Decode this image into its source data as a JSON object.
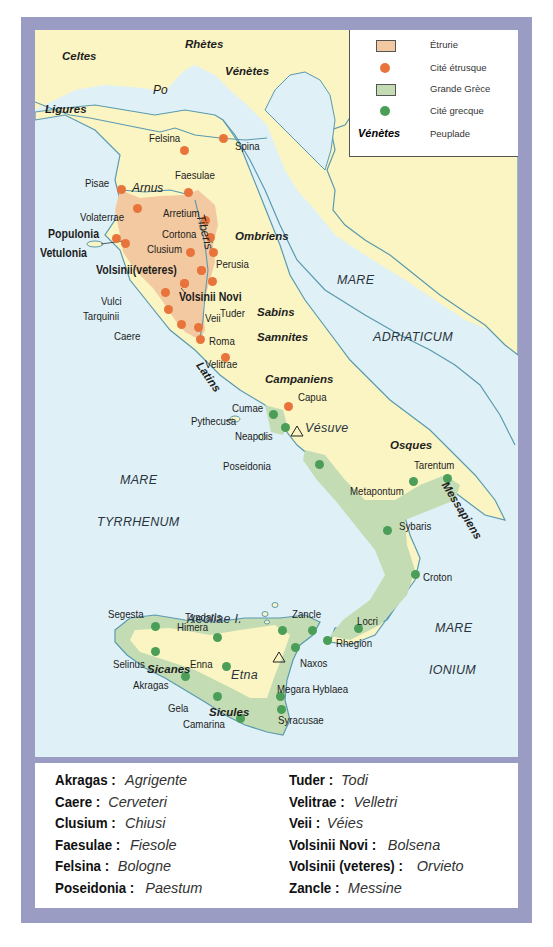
{
  "colors": {
    "frame": "#9a9cc4",
    "sea": "#dff0f6",
    "land": "#fbf5c3",
    "etruria": "#f2c9a0",
    "magna_graecia": "#c4dcb4",
    "coast": "#5a9ab0",
    "etruscan_city": "#e8743c",
    "greek_city": "#4a9e58"
  },
  "legend": {
    "items": [
      {
        "symbol": "etruria-swatch",
        "label": "Étrurie"
      },
      {
        "symbol": "etruscan-city-dot",
        "label": "Cité étrusque"
      },
      {
        "symbol": "magna-graecia-swatch",
        "label": "Grande Grèce"
      },
      {
        "symbol": "greek-city-dot",
        "label": "Cité grecque"
      },
      {
        "symbol": "Vénètes",
        "label": "Peuplade"
      }
    ]
  },
  "map": {
    "peoples": [
      {
        "name": "Celtes",
        "x": 27,
        "y": 21
      },
      {
        "name": "Rhètes",
        "x": 150,
        "y": 9
      },
      {
        "name": "Vénètes",
        "x": 190,
        "y": 36
      },
      {
        "name": "Ligures",
        "x": 10,
        "y": 74
      },
      {
        "name": "Ombriens",
        "x": 200,
        "y": 201
      },
      {
        "name": "Sabins",
        "x": 222,
        "y": 277
      },
      {
        "name": "Samnites",
        "x": 222,
        "y": 302
      },
      {
        "name": "Campaniens",
        "x": 230,
        "y": 344
      },
      {
        "name": "Osques",
        "x": 355,
        "y": 410
      },
      {
        "name": "Sicanes",
        "x": 112,
        "y": 634
      },
      {
        "name": "Sicules",
        "x": 174,
        "y": 677
      }
    ],
    "rotated_peoples": [
      {
        "name": "Latins",
        "x": 168,
        "y": 330,
        "rotate": 55
      },
      {
        "name": "Messapiens",
        "x": 414,
        "y": 450,
        "rotate": 58
      }
    ],
    "rivers": [
      {
        "name": "Po",
        "x": 118,
        "y": 54
      },
      {
        "name": "Arnus",
        "x": 97,
        "y": 152
      }
    ],
    "rotated_rivers": [
      {
        "name": "Tiberis",
        "x": 171,
        "y": 183,
        "rotate": 75
      }
    ],
    "seas": [
      {
        "name": "MARE",
        "x": 302,
        "y": 244
      },
      {
        "name": "ADRIATICUM",
        "x": 338,
        "y": 301
      },
      {
        "name": "MARE",
        "x": 85,
        "y": 444
      },
      {
        "name": "TYRRHENUM",
        "x": 62,
        "y": 486
      },
      {
        "name": "MARE",
        "x": 400,
        "y": 592
      },
      {
        "name": "IONIUM",
        "x": 394,
        "y": 634
      },
      {
        "name": "Aeoliae I.",
        "x": 152,
        "y": 583
      },
      {
        "name": "Etna",
        "x": 196,
        "y": 639
      },
      {
        "name": "Vésuve",
        "x": 270,
        "y": 392
      }
    ],
    "etruscan_cities": [
      {
        "name": "Felsina",
        "label_x": 114,
        "label_y": 103,
        "x": 149,
        "y": 120
      },
      {
        "name": "Spina",
        "label_x": 200,
        "label_y": 111,
        "x": 188,
        "y": 108
      },
      {
        "name": "Faesulae",
        "label_x": 140,
        "label_y": 140,
        "x": 153,
        "y": 162
      },
      {
        "name": "Pisae",
        "label_x": 50,
        "label_y": 148,
        "x": 86,
        "y": 159
      },
      {
        "name": "Arretium",
        "label_x": 128,
        "label_y": 178,
        "x": 170,
        "y": 190
      },
      {
        "name": "Volaterrae",
        "label_x": 45,
        "label_y": 182,
        "x": 102,
        "y": 178
      },
      {
        "name": "Cortona",
        "label_x": 127,
        "label_y": 199,
        "x": 175,
        "y": 207
      },
      {
        "name": "Clusium",
        "label_x": 112,
        "label_y": 214,
        "x": 155,
        "y": 222
      },
      {
        "name": "Perusia",
        "label_x": 181,
        "label_y": 229,
        "x": 178,
        "y": 222
      },
      {
        "name": "Tuder",
        "label_x": 185,
        "label_y": 278,
        "x": 177,
        "y": 251
      },
      {
        "name": "Vulci",
        "label_x": 66,
        "label_y": 266,
        "x": 130,
        "y": 262
      },
      {
        "name": "Tarquinii",
        "label_x": 48,
        "label_y": 281,
        "x": 133,
        "y": 279
      },
      {
        "name": "Veii",
        "label_x": 170,
        "label_y": 283,
        "x": 163,
        "y": 297
      },
      {
        "name": "Caere",
        "label_x": 79,
        "label_y": 301,
        "x": 146,
        "y": 294
      },
      {
        "name": "Roma",
        "label_x": 174,
        "label_y": 306,
        "x": 165,
        "y": 309
      },
      {
        "name": "Velitrae",
        "label_x": 170,
        "label_y": 329,
        "x": 190,
        "y": 327
      },
      {
        "name": "Capua",
        "label_x": 263,
        "label_y": 362,
        "x": 253,
        "y": 376
      },
      {
        "name": "Volsinii(veteres)",
        "x": 166,
        "y": 240
      },
      {
        "name": "Volsinii Novi",
        "x": 149,
        "y": 253
      }
    ],
    "etruscan_cities_bold": [
      {
        "name": "Populonia",
        "x": 13,
        "y": 198,
        "dot_x": 81,
        "dot_y": 208
      },
      {
        "name": "Vetulonia",
        "x": 5,
        "y": 217,
        "dot_x": 90,
        "dot_y": 213
      },
      {
        "name": "Volsinii(veteres)",
        "x": 61,
        "y": 234,
        "dot_x": 166,
        "dot_y": 240
      },
      {
        "name": "Volsinii Novi",
        "x": 144,
        "y": 261,
        "dot_x": 149,
        "dot_y": 253
      }
    ],
    "greek_cities": [
      {
        "name": "Cumae",
        "label_x": 197,
        "label_y": 373,
        "x": 238,
        "y": 384
      },
      {
        "name": "Pythecusa",
        "label_x": 156,
        "label_y": 386,
        "x": 0,
        "y": 0
      },
      {
        "name": "Neapolis",
        "label_x": 200,
        "label_y": 401,
        "x": 250,
        "y": 397
      },
      {
        "name": "Poseidonia",
        "label_x": 188,
        "label_y": 431,
        "x": 284,
        "y": 434
      },
      {
        "name": "Tarentum",
        "label_x": 379,
        "label_y": 430,
        "x": 378,
        "y": 451
      },
      {
        "name": "Metapontum",
        "label_x": 315,
        "label_y": 456,
        "x": 412,
        "y": 448
      },
      {
        "name": "Sybaris",
        "label_x": 364,
        "label_y": 491,
        "x": 352,
        "y": 500
      },
      {
        "name": "Croton",
        "label_x": 388,
        "label_y": 542,
        "x": 380,
        "y": 544
      },
      {
        "name": "Segesta",
        "label_x": 73,
        "label_y": 579,
        "x": 120,
        "y": 596
      },
      {
        "name": "Himera",
        "label_x": 142,
        "label_y": 592,
        "x": 182,
        "y": 607
      },
      {
        "name": "Tyndaris",
        "label_x": 150,
        "label_y": 582,
        "x": 247,
        "y": 600
      },
      {
        "name": "Zancle",
        "label_x": 257,
        "label_y": 579,
        "x": 277,
        "y": 600
      },
      {
        "name": "Locri",
        "label_x": 322,
        "label_y": 586,
        "x": 323,
        "y": 598
      },
      {
        "name": "Rhegion",
        "label_x": 301,
        "label_y": 608,
        "x": 292,
        "y": 610
      },
      {
        "name": "Selinus",
        "label_x": 78,
        "label_y": 629,
        "x": 120,
        "y": 621
      },
      {
        "name": "Naxos",
        "label_x": 265,
        "label_y": 628,
        "x": 260,
        "y": 617
      },
      {
        "name": "Enna",
        "label_x": 155,
        "label_y": 629,
        "x": 191,
        "y": 636
      },
      {
        "name": "Akragas",
        "label_x": 98,
        "label_y": 650,
        "x": 150,
        "y": 646
      },
      {
        "name": "Megara Hyblaea",
        "label_x": 242,
        "label_y": 654,
        "x": 245,
        "y": 666
      },
      {
        "name": "Gela",
        "label_x": 133,
        "label_y": 673,
        "x": 182,
        "y": 666
      },
      {
        "name": "Syracusae",
        "label_x": 243,
        "label_y": 685,
        "x": 246,
        "y": 679
      },
      {
        "name": "Camarina",
        "label_x": 148,
        "label_y": 689,
        "x": 205,
        "y": 688
      }
    ]
  },
  "glossary": {
    "left": [
      {
        "ancient": "Akragas :",
        "modern": "Agrigente"
      },
      {
        "ancient": "Caere :",
        "modern": "Cerveteri"
      },
      {
        "ancient": "Clusium :",
        "modern": "Chiusi"
      },
      {
        "ancient": "Faesulae :",
        "modern": "Fiesole"
      },
      {
        "ancient": "Felsina :",
        "modern": "Bologne"
      },
      {
        "ancient": "Poseidonia :",
        "modern": "Paestum"
      }
    ],
    "right": [
      {
        "ancient": "Tuder :",
        "modern": "Todi"
      },
      {
        "ancient": "Velitrae :",
        "modern": "Velletri"
      },
      {
        "ancient": "Veii :",
        "modern": "Véies"
      },
      {
        "ancient": "Volsinii Novi :",
        "modern": "Bolsena"
      },
      {
        "ancient": "Volsinii (veteres) :",
        "modern": "Orvieto"
      },
      {
        "ancient": "Zancle :",
        "modern": "Messine"
      }
    ]
  }
}
